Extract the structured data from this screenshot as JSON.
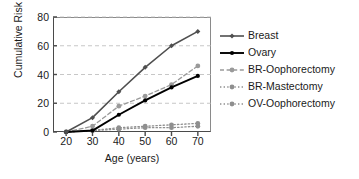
{
  "chart_data": {
    "type": "line",
    "title": "",
    "subtitle": "",
    "xlabel": "Age (years)",
    "ylabel": "Cumulative Risk",
    "x": [
      20,
      30,
      40,
      50,
      60,
      70
    ],
    "xticks": [
      "20",
      "30",
      "40",
      "50",
      "60",
      "70"
    ],
    "yticks": [
      "0",
      "20",
      "40",
      "60",
      "80"
    ],
    "xlim": [
      15,
      75
    ],
    "ylim": [
      0,
      80
    ],
    "grid": "horizontal-dashed",
    "legend_position": "right",
    "series": [
      {
        "name": "Breast",
        "values": [
          0,
          10,
          28,
          45,
          60,
          70
        ],
        "color": "#4f4f4f",
        "marker": "diamond",
        "line_style": "solid"
      },
      {
        "name": "Ovary",
        "values": [
          0,
          1,
          12,
          22,
          31,
          39
        ],
        "color": "#000000",
        "marker": "circle",
        "line_style": "solid"
      },
      {
        "name": "BR-Oophorectomy",
        "values": [
          0,
          4,
          18,
          25,
          33,
          46
        ],
        "color": "#9a9a9a",
        "marker": "circle",
        "line_style": "dashed"
      },
      {
        "name": "BR-Mastectomy",
        "values": [
          0,
          1,
          2,
          3,
          3,
          4
        ],
        "color": "#8f8f8f",
        "marker": "circle",
        "line_style": "dotted"
      },
      {
        "name": "OV-Oophorectomy",
        "values": [
          0,
          1,
          3,
          4,
          5,
          6
        ],
        "color": "#8f8f8f",
        "marker": "circle",
        "line_style": "dotted"
      }
    ]
  },
  "axes": {
    "y_label": "Cumulative Risk",
    "x_label": "Age (years)",
    "y_ticks": [
      {
        "label": "80",
        "value": 80
      },
      {
        "label": "60",
        "value": 60
      },
      {
        "label": "40",
        "value": 40
      },
      {
        "label": "20",
        "value": 20
      },
      {
        "label": "0",
        "value": 0
      }
    ],
    "x_ticks": [
      {
        "label": "20",
        "value": 20
      },
      {
        "label": "30",
        "value": 30
      },
      {
        "label": "40",
        "value": 40
      },
      {
        "label": "50",
        "value": 50
      },
      {
        "label": "60",
        "value": 60
      },
      {
        "label": "70",
        "value": 70
      }
    ]
  },
  "legend": {
    "items": [
      {
        "label": "Breast"
      },
      {
        "label": "Ovary"
      },
      {
        "label": "BR-Oophorectomy"
      },
      {
        "label": "BR-Mastectomy"
      },
      {
        "label": "OV-Oophorectomy"
      }
    ]
  },
  "colors": {
    "axis": "#4a4a4a",
    "grid": "#b9b9b9",
    "text": "#1a1a1a",
    "background": "#ffffff"
  }
}
